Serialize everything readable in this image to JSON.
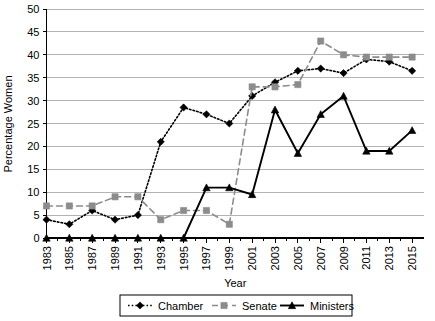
{
  "chart_data": {
    "type": "line",
    "title": "",
    "xlabel": "Year",
    "ylabel": "Percentage Women",
    "ylim": [
      0,
      50
    ],
    "ytick_step": 5,
    "grid": true,
    "legend_position": "bottom",
    "categories": [
      1983,
      1985,
      1987,
      1989,
      1991,
      1993,
      1995,
      1997,
      1999,
      2001,
      2003,
      2005,
      2007,
      2009,
      2011,
      2013,
      2015
    ],
    "yticks": [
      0,
      5,
      10,
      15,
      20,
      25,
      30,
      35,
      40,
      45,
      50
    ],
    "xticks": [
      "1983",
      "1985",
      "1987",
      "1989",
      "1991",
      "1993",
      "1995",
      "1997",
      "1999",
      "2001",
      "2003",
      "2005",
      "2007",
      "2009",
      "2011",
      "2013",
      "2015"
    ],
    "series": [
      {
        "name": "Chamber",
        "marker": "diamond",
        "line_style": "dotted",
        "color": "#000000",
        "values": [
          4,
          3,
          6,
          4,
          5,
          21,
          28.5,
          27,
          25,
          31,
          34,
          36.5,
          37,
          36,
          39,
          38.5,
          36.5
        ]
      },
      {
        "name": "Senate",
        "marker": "square",
        "line_style": "dashed",
        "color": "#8c8c8c",
        "values": [
          7,
          7,
          7,
          9,
          9,
          4,
          6,
          6,
          3,
          33,
          33,
          33.5,
          43,
          40,
          39.5,
          39.5,
          39.5
        ]
      },
      {
        "name": "Ministers",
        "marker": "triangle",
        "line_style": "solid",
        "color": "#000000",
        "values": [
          0,
          0,
          0,
          0,
          0,
          0,
          0,
          11,
          11,
          9.5,
          28,
          18.5,
          27,
          31,
          19,
          19,
          23.5
        ]
      }
    ]
  },
  "legend": {
    "items": [
      {
        "label": "Chamber",
        "marker": "diamond",
        "line_style": "dotted",
        "color": "#000000"
      },
      {
        "label": "Senate",
        "marker": "square",
        "line_style": "dashed",
        "color": "#8c8c8c"
      },
      {
        "label": "Ministers",
        "marker": "triangle",
        "line_style": "solid",
        "color": "#000000"
      }
    ]
  },
  "colors": {
    "chamber": "#000000",
    "senate": "#8c8c8c",
    "ministers": "#000000",
    "gridline": "#b3b3b3",
    "axis": "#000000",
    "background": "#ffffff"
  }
}
